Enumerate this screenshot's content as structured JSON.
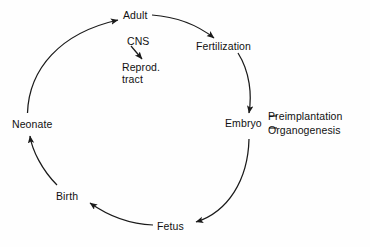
{
  "diagram": {
    "type": "cycle-diagram",
    "background_color": "#fefefe",
    "stroke_color": "#1a1a1a",
    "text_color": "#111111",
    "nodes": [
      {
        "id": "adult",
        "label": "Adult",
        "position": "top"
      },
      {
        "id": "fertilization",
        "label": "Fertilization",
        "position": "upper-right"
      },
      {
        "id": "embryo",
        "label": "Embryo",
        "position": "right"
      },
      {
        "id": "fetus",
        "label": "Fetus",
        "position": "bottom"
      },
      {
        "id": "birth",
        "label": "Birth",
        "position": "lower-left"
      },
      {
        "id": "neonate",
        "label": "Neonate",
        "position": "left"
      }
    ],
    "center": {
      "source_label": "CNS",
      "target_label_line1": "Reprod.",
      "target_label_line2": "tract",
      "arrow_direction": "down-right"
    },
    "annotations": {
      "embryo": [
        {
          "dash": "—",
          "label": "Preimplantation"
        },
        {
          "dash": "—",
          "label": "Organogenesis"
        }
      ]
    },
    "flow": [
      "Adult → Fertilization",
      "Fertilization → Embryo",
      "Embryo → Fetus",
      "Fetus → Birth",
      "Birth → Neonate",
      "Neonate → Adult"
    ]
  }
}
